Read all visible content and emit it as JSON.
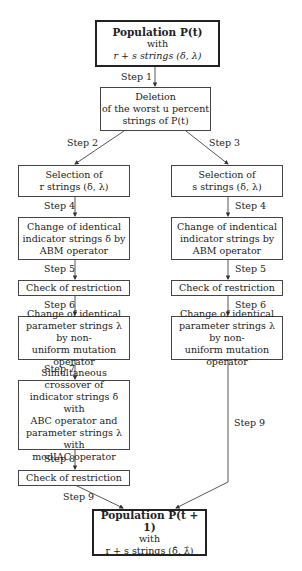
{
  "diagram": {
    "start": {
      "title": "Population P(t)",
      "line2": "with",
      "line3": "r + s strings (δ, λ)"
    },
    "deletion": {
      "line1": "Deletion",
      "line2": "of the worst u percent",
      "line3": "strings of P(t)"
    },
    "left": {
      "selection": {
        "line1": "Selection of",
        "line2": "r strings (δ, λ)"
      },
      "abm": {
        "line1": "Change of identical",
        "line2": "indicator strings δ by",
        "line3": "ABM operator"
      },
      "check1": "Check of restriction",
      "mutation": {
        "line1": "Change of identical",
        "line2": "parameter strings λ by non-",
        "line3": "uniform mutation operator"
      },
      "crossover": {
        "line1": "Simultaneous crossover of",
        "line2": "indicator strings δ with",
        "line3": "ABC operator and",
        "line4": "parameter strings λ with",
        "line5": "modIAC operator"
      },
      "check2": "Check of restriction"
    },
    "right": {
      "selection": {
        "line1": "Selection of",
        "line2": "s strings (δ, λ)"
      },
      "abm": {
        "line1": "Change of indentical",
        "line2": "indicator strings by",
        "line3": "ABM operator"
      },
      "check1": "Check of restriction",
      "mutation": {
        "line1": "Change of identical",
        "line2": "parameter strings λ by non-",
        "line3": "uniform mutation operator"
      }
    },
    "end": {
      "title": "Population P(t + 1)",
      "line2": "with",
      "line3": "r + s strings (δ̂, λ̂)"
    },
    "steps": {
      "s1": "Step 1",
      "s2": "Step 2",
      "s3": "Step 3",
      "s4l": "Step 4",
      "s4r": "Step 4",
      "s5l": "Step 5",
      "s5r": "Step 5",
      "s6l": "Step 6",
      "s6r": "Step 6",
      "s7": "Step 7",
      "s8": "Step 8",
      "s9l": "Step 9",
      "s9r": "Step 9"
    }
  }
}
